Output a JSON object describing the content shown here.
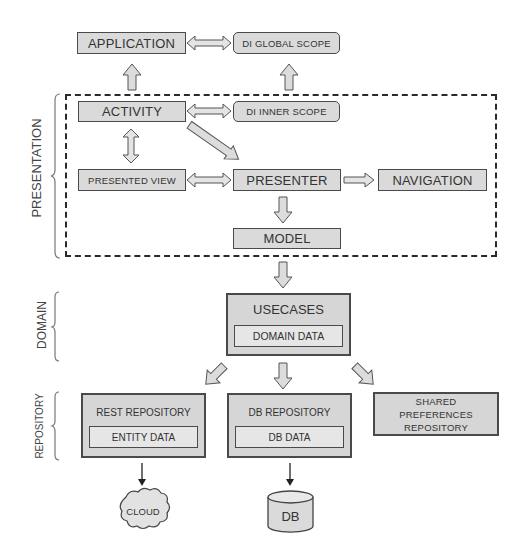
{
  "diagram": {
    "layers": {
      "presentation": "PRESENTATION",
      "domain": "DOMAIN",
      "repository": "REPOSITORY"
    },
    "nodes": {
      "application": "APPLICATION",
      "di_global_scope": "DI GLOBAL SCOPE",
      "activity": "ACTIVITY",
      "di_inner_scope": "DI INNER SCOPE",
      "presented_view": "PRESENTED VIEW",
      "presenter": "PRESENTER",
      "navigation": "NAVIGATION",
      "model": "MODEL",
      "usecases": "USECASES",
      "domain_data": "DOMAIN DATA",
      "rest_repository": "REST REPOSITORY",
      "entity_data": "ENTITY DATA",
      "db_repository": "DB REPOSITORY",
      "db_data": "DB DATA",
      "shared_preferences_repository_line1": "SHARED",
      "shared_preferences_repository_line2": "PREFERENCES",
      "shared_preferences_repository_line3": "REPOSITORY",
      "cloud": "CLOUD",
      "db": "DB"
    },
    "edges": [
      {
        "from": "APPLICATION",
        "to": "DI GLOBAL SCOPE",
        "type": "bidirectional"
      },
      {
        "from": "ACTIVITY",
        "to": "APPLICATION",
        "type": "up"
      },
      {
        "from": "DI INNER SCOPE",
        "to": "DI GLOBAL SCOPE",
        "type": "up"
      },
      {
        "from": "ACTIVITY",
        "to": "DI INNER SCOPE",
        "type": "bidirectional"
      },
      {
        "from": "ACTIVITY",
        "to": "PRESENTED VIEW",
        "type": "bidirectional"
      },
      {
        "from": "ACTIVITY",
        "to": "PRESENTER",
        "type": "directed"
      },
      {
        "from": "PRESENTED VIEW",
        "to": "PRESENTER",
        "type": "bidirectional"
      },
      {
        "from": "PRESENTER",
        "to": "NAVIGATION",
        "type": "directed"
      },
      {
        "from": "PRESENTER",
        "to": "MODEL",
        "type": "directed"
      },
      {
        "from": "PRESENTATION",
        "to": "USECASES",
        "type": "directed"
      },
      {
        "from": "USECASES",
        "to": "REST REPOSITORY",
        "type": "directed"
      },
      {
        "from": "USECASES",
        "to": "DB REPOSITORY",
        "type": "directed"
      },
      {
        "from": "USECASES",
        "to": "SHARED PREFERENCES REPOSITORY",
        "type": "directed"
      },
      {
        "from": "REST REPOSITORY",
        "to": "CLOUD",
        "type": "directed"
      },
      {
        "from": "DB REPOSITORY",
        "to": "DB",
        "type": "directed"
      }
    ]
  },
  "colors": {
    "box_fill": "#dadada",
    "inner_fill": "#e6e6e6",
    "border": "#4a4a4a",
    "arrow_fill": "#d0d0d0",
    "text": "#333333"
  }
}
